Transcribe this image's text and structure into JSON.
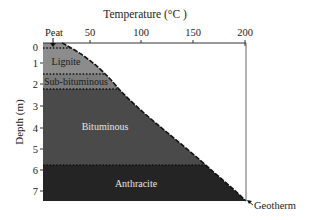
{
  "diagram": {
    "title": "Temperature (°C )",
    "x_axis": {
      "label": "Temperature (°C )",
      "ticks": [
        {
          "value": 50,
          "label": "50",
          "x": 90
        },
        {
          "value": 100,
          "label": "100",
          "x": 141
        },
        {
          "value": 150,
          "label": "150",
          "x": 193
        },
        {
          "value": 200,
          "label": "200",
          "x": 245
        }
      ],
      "peat_label": "Peat"
    },
    "y_axis": {
      "label": "Depth (m)",
      "ticks": [
        {
          "value": 0,
          "label": "0",
          "y": 47
        },
        {
          "value": 1,
          "label": "1",
          "y": 63
        },
        {
          "value": 2,
          "label": "2",
          "y": 84
        },
        {
          "value": 3,
          "label": "3",
          "y": 106
        },
        {
          "value": 4,
          "label": "4",
          "y": 128
        },
        {
          "value": 5,
          "label": "5",
          "y": 149
        },
        {
          "value": 6,
          "label": "6",
          "y": 170
        },
        {
          "value": 7,
          "label": "7",
          "y": 191
        }
      ]
    },
    "layers": [
      {
        "name": "Peat",
        "label": "",
        "color": "#8c8c8c",
        "top_depth": 0,
        "bottom_depth": 0.1
      },
      {
        "name": "Lignite",
        "label": "Lignite",
        "color": "#8c8c8c",
        "top_depth": 0.1,
        "bottom_depth": 1.3
      },
      {
        "name": "Sub-bituminous",
        "label": "Sub-bituminous",
        "color": "#7b7b7b",
        "top_depth": 1.3,
        "bottom_depth": 2.1
      },
      {
        "name": "Bituminous",
        "label": "Bituminous",
        "color": "#4a4a4a",
        "top_depth": 2.1,
        "bottom_depth": 5.7
      },
      {
        "name": "Anthracite",
        "label": "Anthracite",
        "color": "#242424",
        "top_depth": 5.7,
        "bottom_depth": 7.6
      }
    ],
    "geotherm_label": "Geotherm"
  }
}
